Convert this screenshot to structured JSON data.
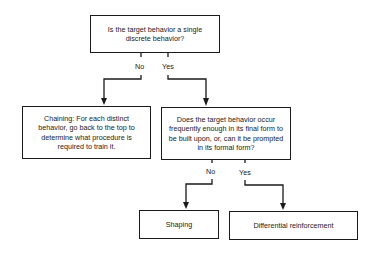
{
  "diagram": {
    "type": "decision-flowchart",
    "nodes": {
      "q1": {
        "text": "Is the target behavior a single discrete behavior?"
      },
      "chaining": {
        "text": "Chaining: For each distinct behavior, go back to the top to determine what procedure is required to train it."
      },
      "q2": {
        "text": "Does the target behavior occur frequently enough in its final form to be built upon, or, can it be prompted in its formal form?"
      },
      "shaping": {
        "text": "Shaping"
      },
      "differential": {
        "text": "Differential reinforcement"
      }
    },
    "edges": {
      "q1_no": {
        "label": "No",
        "from": "q1",
        "to": "chaining"
      },
      "q1_yes": {
        "label": "Yes",
        "from": "q1",
        "to": "q2"
      },
      "q2_no": {
        "label": "No",
        "from": "q2",
        "to": "shaping"
      },
      "q2_yes": {
        "label": "Yes",
        "from": "q2",
        "to": "differential"
      }
    }
  }
}
